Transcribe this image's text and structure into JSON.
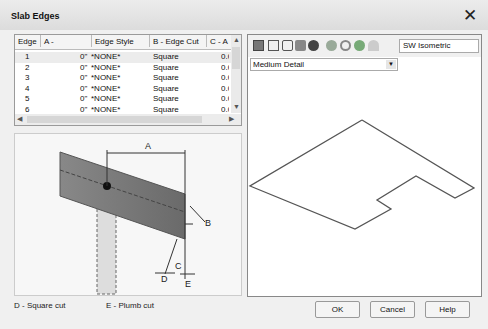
{
  "window": {
    "title": "Slab Edges",
    "close_icon": "✕"
  },
  "table": {
    "columns": [
      "Edge",
      "A - Overhang",
      "Edge Style",
      "B - Edge Cut",
      "C - A"
    ],
    "rows": [
      {
        "edge": "1",
        "overhang": "0\"",
        "style": "*NONE*",
        "cut": "Square",
        "c": "0.0"
      },
      {
        "edge": "2",
        "overhang": "0\"",
        "style": "*NONE*",
        "cut": "Square",
        "c": "0.0"
      },
      {
        "edge": "3",
        "overhang": "0\"",
        "style": "*NONE*",
        "cut": "Square",
        "c": "0.0"
      },
      {
        "edge": "4",
        "overhang": "0\"",
        "style": "*NONE*",
        "cut": "Square",
        "c": "0.0"
      },
      {
        "edge": "5",
        "overhang": "0\"",
        "style": "*NONE*",
        "cut": "Square",
        "c": "0.0"
      },
      {
        "edge": "6",
        "overhang": "0\"",
        "style": "*NONE*",
        "cut": "Square",
        "c": "0.0"
      }
    ]
  },
  "diagram": {
    "labels": {
      "a": "A",
      "b": "B",
      "c": "C",
      "d": "D",
      "e": "E"
    },
    "legend_d": "D - Square cut",
    "legend_e": "E - Plumb cut"
  },
  "viewer": {
    "view": "SW Isometric",
    "detail": "Medium Detail"
  },
  "buttons": {
    "ok": "OK",
    "cancel": "Cancel",
    "help": "Help"
  }
}
